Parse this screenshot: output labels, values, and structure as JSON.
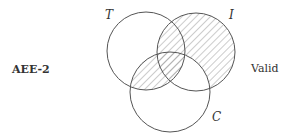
{
  "form_label": "AEE-2",
  "verdict": "Valid",
  "circles": {
    "T": {
      "label": "T",
      "cx": 146,
      "cy": 51,
      "r": 39
    },
    "I": {
      "label": "I",
      "cx": 196,
      "cy": 52,
      "r": 39
    },
    "C": {
      "label": "C",
      "cx": 170,
      "cy": 92,
      "r": 40
    }
  },
  "shaded_regions": [
    "I only",
    "T∩I not C",
    "T∩I∩C",
    "T∩C not I"
  ],
  "colors": {
    "stroke": "#555555",
    "hatch": "#9a9a9a"
  }
}
